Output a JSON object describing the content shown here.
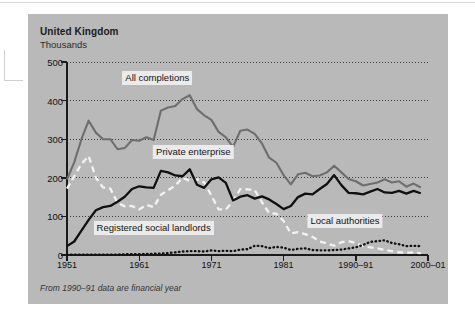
{
  "header": {
    "title": "United Kingdom",
    "subtitle": "Thousands"
  },
  "footnote": "From 1990–91 data are financial year",
  "labels": {
    "all_completions": "All completions",
    "private_enterprise": "Private enterprise",
    "registered_social_landlords": "Registered social landlords",
    "local_authorities": "Local authorities"
  },
  "colors": {
    "panel": "#b9b9b9",
    "all_completions": "#6e6e6e",
    "private_enterprise": "#101010",
    "local_authorities": "#f2f2f2",
    "registered_social_landlords": "#101010",
    "axis": "#1a1a1a",
    "gridline": "#3a3a3a",
    "label_background": "#ebebeb"
  },
  "chart_data": {
    "type": "line",
    "title": "United Kingdom",
    "subtitle": "Thousands",
    "xlabel": "",
    "ylabel": "Thousands",
    "ylim": [
      0,
      500
    ],
    "yticks": [
      0,
      100,
      200,
      300,
      400,
      500
    ],
    "ytick_labels": [
      "0",
      "100",
      "200",
      "300",
      "400",
      "500"
    ],
    "xlim": [
      1951,
      2001
    ],
    "xticks": [
      1951,
      1961,
      1971,
      1981,
      1991,
      2001
    ],
    "xtick_labels": [
      "1951",
      "1961",
      "1971",
      "1981",
      "1990–91",
      "2000–01"
    ],
    "grid": true,
    "legend": "inline-annotations",
    "note": "From 1990–91 data are financial year",
    "x": [
      1951,
      1952,
      1953,
      1954,
      1955,
      1956,
      1957,
      1958,
      1959,
      1960,
      1961,
      1962,
      1963,
      1964,
      1965,
      1966,
      1967,
      1968,
      1969,
      1970,
      1971,
      1972,
      1973,
      1974,
      1975,
      1976,
      1977,
      1978,
      1979,
      1980,
      1981,
      1982,
      1983,
      1984,
      1985,
      1986,
      1987,
      1988,
      1989,
      1990,
      1991,
      1992,
      1993,
      1994,
      1995,
      1996,
      1997,
      1998,
      1999,
      2000
    ],
    "series": [
      {
        "name": "All completions",
        "style": "solid-grey",
        "values": [
          196,
          240,
          300,
          348,
          317,
          300,
          300,
          274,
          277,
          298,
          296,
          305,
          298,
          374,
          382,
          386,
          404,
          414,
          378,
          362,
          350,
          319,
          305,
          280,
          322,
          325,
          314,
          289,
          252,
          239,
          207,
          183,
          209,
          213,
          204,
          206,
          214,
          231,
          214,
          197,
          191,
          180,
          184,
          188,
          196,
          188,
          191,
          177,
          185,
          175
        ]
      },
      {
        "name": "Private enterprise",
        "style": "solid-black",
        "values": [
          23,
          35,
          63,
          91,
          116,
          124,
          127,
          138,
          151,
          171,
          178,
          175,
          174,
          218,
          214,
          206,
          204,
          222,
          182,
          174,
          196,
          201,
          187,
          141,
          151,
          155,
          146,
          152,
          144,
          132,
          119,
          127,
          150,
          159,
          157,
          171,
          184,
          207,
          181,
          161,
          160,
          157,
          164,
          171,
          162,
          161,
          166,
          159,
          166,
          160
        ]
      },
      {
        "name": "Local authorities",
        "style": "dashed-white",
        "values": [
          172,
          204,
          236,
          256,
          200,
          175,
          172,
          135,
          126,
          127,
          118,
          130,
          124,
          156,
          168,
          180,
          200,
          192,
          196,
          188,
          154,
          118,
          118,
          139,
          171,
          170,
          168,
          137,
          108,
          107,
          88,
          56,
          59,
          54,
          47,
          35,
          30,
          24,
          33,
          36,
          31,
          23,
          20,
          17,
          13,
          10,
          7,
          6,
          6,
          5
        ]
      },
      {
        "name": "Registered social landlords",
        "style": "dotted-black",
        "values": [
          1,
          1,
          1,
          1,
          1,
          1,
          1,
          1,
          2,
          2,
          2,
          3,
          3,
          4,
          5,
          7,
          9,
          10,
          10,
          9,
          12,
          10,
          11,
          10,
          14,
          15,
          24,
          23,
          18,
          21,
          19,
          13,
          16,
          17,
          13,
          12,
          12,
          13,
          14,
          17,
          20,
          26,
          34,
          36,
          38,
          31,
          28,
          23,
          24,
          23
        ]
      }
    ],
    "annotations": [
      {
        "text": "All completions",
        "x": 1963.5,
        "y": 458
      },
      {
        "text": "Private enterprise",
        "x": 1968.5,
        "y": 268
      },
      {
        "text": "Registered social landlords",
        "x": 1963.0,
        "y": 70
      },
      {
        "text": "Local authorities",
        "x": 1989.5,
        "y": 88
      }
    ]
  }
}
